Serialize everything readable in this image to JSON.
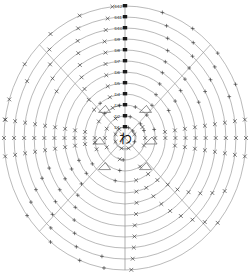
{
  "chart_data": {
    "type": "scatter",
    "title": "",
    "subtitle": "",
    "xlabel": "",
    "ylabel": "",
    "projection": "polar",
    "grid": true,
    "legend_position": "none",
    "center_label": "わ",
    "radial_axis": {
      "orientation": "vertical-up",
      "tick_labels": [
        "D1",
        "D2",
        "D3",
        "D4",
        "D5",
        "D6",
        "D7",
        "D8",
        "D9",
        "D10",
        "D11",
        "D12"
      ],
      "tick_order": "inner-to-outer",
      "rlim": [
        0,
        12
      ]
    },
    "angular_axis": {
      "spoke_count": 4,
      "spoke_angles_deg": [
        45,
        135,
        225,
        315
      ],
      "vertical_axis_deg": [
        90,
        270
      ]
    },
    "series": [
      {
        "name": "x-markers",
        "marker": "x",
        "color": "#3a3a3a",
        "points": [
          {
            "r": 12,
            "theta": 96
          },
          {
            "r": 11,
            "theta": 99
          },
          {
            "r": 10,
            "theta": 101
          },
          {
            "r": 9,
            "theta": 103
          },
          {
            "r": 8,
            "theta": 104
          },
          {
            "r": 7,
            "theta": 106
          },
          {
            "r": 6,
            "theta": 108
          },
          {
            "r": 5,
            "theta": 110
          },
          {
            "r": 4,
            "theta": 112
          },
          {
            "r": 3,
            "theta": 114
          },
          {
            "r": 2,
            "theta": 118
          },
          {
            "r": 1,
            "theta": 125
          },
          {
            "r": 12,
            "theta": 112
          },
          {
            "r": 11,
            "theta": 115
          },
          {
            "r": 10,
            "theta": 118
          },
          {
            "r": 9,
            "theta": 121
          },
          {
            "r": 8,
            "theta": 124
          },
          {
            "r": 7,
            "theta": 128
          },
          {
            "r": 6,
            "theta": 132
          },
          {
            "r": 5,
            "theta": 136
          },
          {
            "r": 4,
            "theta": 140
          },
          {
            "r": 12,
            "theta": 128
          },
          {
            "r": 11,
            "theta": 133
          },
          {
            "r": 10,
            "theta": 138
          },
          {
            "r": 9,
            "theta": 143
          },
          {
            "r": 8,
            "theta": 148
          },
          {
            "r": 12,
            "theta": 146
          },
          {
            "r": 11,
            "theta": 152
          },
          {
            "r": 12,
            "theta": 163
          },
          {
            "r": 12,
            "theta": 172
          },
          {
            "r": 12,
            "theta": 180
          },
          {
            "r": 11,
            "theta": 180
          },
          {
            "r": 10,
            "theta": 180
          },
          {
            "r": 9,
            "theta": 180
          },
          {
            "r": 8,
            "theta": 180
          },
          {
            "r": 7,
            "theta": 180
          },
          {
            "r": 6,
            "theta": 180
          },
          {
            "r": 5,
            "theta": 180
          },
          {
            "r": 4,
            "theta": 180
          },
          {
            "r": 3,
            "theta": 180
          },
          {
            "r": 2,
            "theta": 180
          },
          {
            "r": 12,
            "theta": 188
          },
          {
            "r": 11,
            "theta": 188
          },
          {
            "r": 10,
            "theta": 188
          },
          {
            "r": 9,
            "theta": 188
          },
          {
            "r": 8,
            "theta": 188
          },
          {
            "r": 7,
            "theta": 188
          },
          {
            "r": 6,
            "theta": 188
          },
          {
            "r": 5,
            "theta": 188
          },
          {
            "r": 4,
            "theta": 188
          },
          {
            "r": 3,
            "theta": 188
          },
          {
            "r": 12,
            "theta": 172
          },
          {
            "r": 11,
            "theta": 172
          },
          {
            "r": 10,
            "theta": 172
          },
          {
            "r": 9,
            "theta": 172
          },
          {
            "r": 8,
            "theta": 172
          },
          {
            "r": 7,
            "theta": 172
          },
          {
            "r": 6,
            "theta": 172
          },
          {
            "r": 5,
            "theta": 172
          },
          {
            "r": 4,
            "theta": 172
          },
          {
            "r": 12,
            "theta": 0
          },
          {
            "r": 11,
            "theta": 0
          },
          {
            "r": 10,
            "theta": 0
          },
          {
            "r": 9,
            "theta": 0
          },
          {
            "r": 8,
            "theta": 0
          },
          {
            "r": 7,
            "theta": 0
          },
          {
            "r": 6,
            "theta": 0
          },
          {
            "r": 5,
            "theta": 0
          },
          {
            "r": 4,
            "theta": 0
          },
          {
            "r": 3,
            "theta": 0
          },
          {
            "r": 2,
            "theta": 0
          },
          {
            "r": 12,
            "theta": 8
          },
          {
            "r": 11,
            "theta": 8
          },
          {
            "r": 10,
            "theta": 8
          },
          {
            "r": 9,
            "theta": 8
          },
          {
            "r": 8,
            "theta": 8
          },
          {
            "r": 7,
            "theta": 8
          },
          {
            "r": 6,
            "theta": 8
          },
          {
            "r": 5,
            "theta": 8
          },
          {
            "r": 4,
            "theta": 8
          },
          {
            "r": 12,
            "theta": 352
          },
          {
            "r": 11,
            "theta": 352
          },
          {
            "r": 10,
            "theta": 352
          },
          {
            "r": 9,
            "theta": 352
          },
          {
            "r": 8,
            "theta": 352
          },
          {
            "r": 7,
            "theta": 352
          },
          {
            "r": 6,
            "theta": 352
          },
          {
            "r": 5,
            "theta": 352
          },
          {
            "r": 1,
            "theta": 20
          },
          {
            "r": 2,
            "theta": 340
          },
          {
            "r": 2,
            "theta": 30
          },
          {
            "r": 3,
            "theta": 300
          },
          {
            "r": 4,
            "theta": 305
          },
          {
            "r": 5,
            "theta": 310
          },
          {
            "r": 6,
            "theta": 315
          },
          {
            "r": 7,
            "theta": 318
          },
          {
            "r": 8,
            "theta": 322
          },
          {
            "r": 9,
            "theta": 326
          },
          {
            "r": 10,
            "theta": 330
          },
          {
            "r": 11,
            "theta": 334
          },
          {
            "r": 5,
            "theta": 295
          },
          {
            "r": 6,
            "theta": 298
          },
          {
            "r": 7,
            "theta": 301
          },
          {
            "r": 8,
            "theta": 304
          },
          {
            "r": 9,
            "theta": 308
          },
          {
            "r": 10,
            "theta": 312
          },
          {
            "r": 11,
            "theta": 316
          },
          {
            "r": 12,
            "theta": 320
          },
          {
            "r": 4,
            "theta": 286
          },
          {
            "r": 5,
            "theta": 283
          },
          {
            "r": 6,
            "theta": 281
          },
          {
            "r": 7,
            "theta": 279
          },
          {
            "r": 8,
            "theta": 277
          },
          {
            "r": 9,
            "theta": 276
          },
          {
            "r": 10,
            "theta": 275
          },
          {
            "r": 11,
            "theta": 274
          },
          {
            "r": 12,
            "theta": 273
          },
          {
            "r": 1,
            "theta": 250
          },
          {
            "r": 2,
            "theta": 255
          },
          {
            "r": 1,
            "theta": 290
          },
          {
            "r": 2,
            "theta": 205
          },
          {
            "r": 3,
            "theta": 200
          },
          {
            "r": 1,
            "theta": 160
          },
          {
            "r": 2,
            "theta": 155
          },
          {
            "r": 3,
            "theta": 150
          },
          {
            "r": 1,
            "theta": 200
          }
        ]
      },
      {
        "name": "plus-markers",
        "marker": "+",
        "color": "#3a3a3a",
        "points": [
          {
            "r": 12,
            "theta": 72
          },
          {
            "r": 11,
            "theta": 68
          },
          {
            "r": 10,
            "theta": 65
          },
          {
            "r": 9,
            "theta": 62
          },
          {
            "r": 8,
            "theta": 60
          },
          {
            "r": 7,
            "theta": 58
          },
          {
            "r": 6,
            "theta": 55
          },
          {
            "r": 5,
            "theta": 52
          },
          {
            "r": 4,
            "theta": 48
          },
          {
            "r": 3,
            "theta": 44
          },
          {
            "r": 2,
            "theta": 40
          },
          {
            "r": 12,
            "theta": 56
          },
          {
            "r": 11,
            "theta": 52
          },
          {
            "r": 10,
            "theta": 48
          },
          {
            "r": 9,
            "theta": 45
          },
          {
            "r": 8,
            "theta": 42
          },
          {
            "r": 7,
            "theta": 38
          },
          {
            "r": 6,
            "theta": 34
          },
          {
            "r": 5,
            "theta": 30
          },
          {
            "r": 12,
            "theta": 40
          },
          {
            "r": 11,
            "theta": 36
          },
          {
            "r": 10,
            "theta": 32
          },
          {
            "r": 9,
            "theta": 28
          },
          {
            "r": 8,
            "theta": 24
          },
          {
            "r": 12,
            "theta": 24
          },
          {
            "r": 11,
            "theta": 20
          },
          {
            "r": 3,
            "theta": 70
          },
          {
            "r": 3,
            "theta": 100
          },
          {
            "r": 2,
            "theta": 75
          },
          {
            "r": 4,
            "theta": 128
          },
          {
            "r": 3,
            "theta": 132
          },
          {
            "r": 12,
            "theta": 248
          },
          {
            "r": 11,
            "theta": 244
          },
          {
            "r": 10,
            "theta": 240
          },
          {
            "r": 9,
            "theta": 236
          },
          {
            "r": 8,
            "theta": 232
          },
          {
            "r": 7,
            "theta": 228
          },
          {
            "r": 6,
            "theta": 224
          },
          {
            "r": 5,
            "theta": 220
          },
          {
            "r": 4,
            "theta": 216
          },
          {
            "r": 12,
            "theta": 232
          },
          {
            "r": 11,
            "theta": 228
          },
          {
            "r": 10,
            "theta": 224
          },
          {
            "r": 9,
            "theta": 220
          },
          {
            "r": 8,
            "theta": 216
          },
          {
            "r": 7,
            "theta": 212
          },
          {
            "r": 6,
            "theta": 208
          },
          {
            "r": 5,
            "theta": 204
          },
          {
            "r": 12,
            "theta": 216
          },
          {
            "r": 11,
            "theta": 212
          },
          {
            "r": 10,
            "theta": 208
          },
          {
            "r": 9,
            "theta": 204
          },
          {
            "r": 8,
            "theta": 200
          },
          {
            "r": 12,
            "theta": 260
          },
          {
            "r": 11,
            "theta": 258
          },
          {
            "r": 3,
            "theta": 260
          },
          {
            "r": 4,
            "theta": 256
          },
          {
            "r": 2,
            "theta": 265
          },
          {
            "r": 2,
            "theta": 20
          },
          {
            "r": 3,
            "theta": 15
          },
          {
            "r": 1,
            "theta": 40
          },
          {
            "r": 1,
            "theta": 70
          },
          {
            "r": 2,
            "theta": 90
          },
          {
            "r": 1,
            "theta": 340
          }
        ]
      }
    ],
    "annotations": [
      {
        "label": "",
        "marker": "arrow-triangle",
        "r": 3.3,
        "theta": 128
      },
      {
        "label": "",
        "marker": "arrow-triangle",
        "r": 3.3,
        "theta": 52
      },
      {
        "label": "",
        "marker": "arrow-triangle",
        "r": 3.3,
        "theta": 232
      },
      {
        "label": "",
        "marker": "arrow-triangle",
        "r": 3.3,
        "theta": 308
      },
      {
        "label": "",
        "marker": "arrow-triangle",
        "r": 2.6,
        "theta": 186
      },
      {
        "label": "",
        "marker": "arrow-triangle",
        "r": 2.6,
        "theta": 354
      }
    ]
  }
}
